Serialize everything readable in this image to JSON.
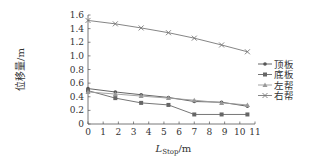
{
  "chart_data": {
    "type": "line",
    "title": "",
    "xlabel": "L_Stop/m",
    "xlabel_main": "L",
    "xlabel_sub": "Stop",
    "xlabel_unit": "/m",
    "ylabel": "位移量/m",
    "xlim": [
      0,
      11
    ],
    "ylim": [
      0,
      1.6
    ],
    "xticks": [
      "0",
      "1",
      "2",
      "3",
      "4",
      "5",
      "6",
      "7",
      "8",
      "9",
      "10",
      "11"
    ],
    "yticks": [
      "0",
      "0.2",
      "0.4",
      "0.6",
      "0.8",
      "1.0",
      "1.2",
      "1.4",
      "1.6"
    ],
    "grid": false,
    "legend_position": "right",
    "x": [
      0,
      1.8,
      3.5,
      5.3,
      7.0,
      8.8,
      10.5
    ],
    "series": [
      {
        "name": "顶板",
        "marker": "dot",
        "values": [
          0.52,
          0.47,
          0.43,
          0.39,
          0.33,
          0.32,
          0.26
        ]
      },
      {
        "name": "底板",
        "marker": "square",
        "values": [
          0.49,
          0.38,
          0.31,
          0.28,
          0.14,
          0.14,
          0.14
        ]
      },
      {
        "name": "左帮",
        "marker": "triangle",
        "values": [
          0.47,
          0.44,
          0.41,
          0.38,
          0.35,
          0.31,
          0.28
        ]
      },
      {
        "name": "右帮",
        "marker": "x",
        "values": [
          1.52,
          1.47,
          1.41,
          1.34,
          1.26,
          1.16,
          1.06
        ]
      }
    ]
  },
  "colors": {
    "axis": "#555555",
    "series": [
      "#555555",
      "#666666",
      "#999999",
      "#777777"
    ]
  }
}
